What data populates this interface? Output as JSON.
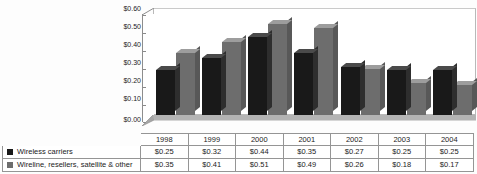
{
  "chart_data": {
    "type": "bar",
    "title": "",
    "xlabel": "",
    "ylabel": "",
    "ylim": [
      0,
      0.6
    ],
    "ytick_labels": [
      "$0.60",
      "$0.50",
      "$0.40",
      "$0.30",
      "$0.20",
      "$0.10",
      "$0.00"
    ],
    "ytick_values": [
      0.6,
      0.5,
      0.4,
      0.3,
      0.2,
      0.1,
      0.0
    ],
    "grid": false,
    "legend_position": "data-table-below",
    "categories": [
      "1998",
      "1999",
      "2000",
      "2001",
      "2002",
      "2003",
      "2004"
    ],
    "series": [
      {
        "name": "Wireless carriers",
        "color": "#191919",
        "values": [
          0.25,
          0.32,
          0.44,
          0.35,
          0.27,
          0.25,
          0.25
        ],
        "labels": [
          "$0.25",
          "$0.32",
          "$0.44",
          "$0.35",
          "$0.27",
          "$0.25",
          "$0.25"
        ]
      },
      {
        "name": "Wireline, resellers, satellite & other",
        "color": "#6d6d6d",
        "values": [
          0.35,
          0.41,
          0.51,
          0.49,
          0.26,
          0.18,
          0.17
        ],
        "labels": [
          "$0.35",
          "$0.41",
          "$0.51",
          "$0.49",
          "$0.26",
          "$0.18",
          "$0.17"
        ]
      }
    ]
  },
  "table": {
    "year_header": [
      "1998",
      "1999",
      "2000",
      "2001",
      "2002",
      "2003",
      "2004"
    ],
    "rows": [
      {
        "label": "Wireless carriers",
        "swatch": "dark",
        "values": [
          "$0.25",
          "$0.32",
          "$0.44",
          "$0.35",
          "$0.27",
          "$0.25",
          "$0.25"
        ]
      },
      {
        "label": "Wireline, resellers, satellite & other",
        "swatch": "gray",
        "values": [
          "$0.35",
          "$0.41",
          "$0.51",
          "$0.49",
          "$0.26",
          "$0.18",
          "$0.17"
        ]
      }
    ]
  }
}
